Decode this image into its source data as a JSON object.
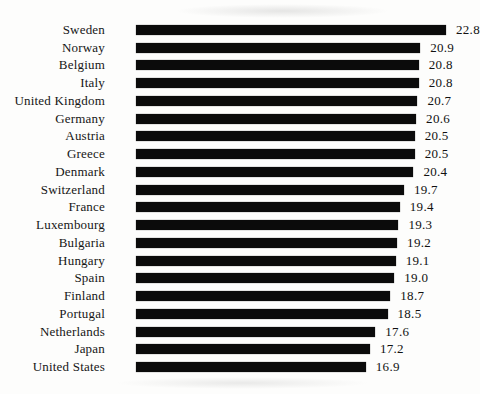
{
  "page": {
    "background_color": "#fdfdfc",
    "bar_color": "#0b0b0b",
    "text_color": "#161616"
  },
  "chart_data": {
    "type": "bar",
    "orientation": "horizontal",
    "title": "",
    "xlabel": "",
    "ylabel": "",
    "grid": false,
    "legend": false,
    "xlim": [
      0,
      22.8
    ],
    "categories": [
      "Sweden",
      "Norway",
      "Belgium",
      "Italy",
      "United Kingdom",
      "Germany",
      "Austria",
      "Greece",
      "Denmark",
      "Switzerland",
      "France",
      "Luxembourg",
      "Bulgaria",
      "Hungary",
      "Spain",
      "Finland",
      "Portugal",
      "Netherlands",
      "Japan",
      "United States"
    ],
    "values": [
      22.8,
      20.9,
      20.8,
      20.8,
      20.7,
      20.6,
      20.5,
      20.5,
      20.4,
      19.7,
      19.4,
      19.3,
      19.2,
      19.1,
      19.0,
      18.7,
      18.5,
      17.6,
      17.2,
      16.9
    ],
    "value_labels": [
      "22.8",
      "20.9",
      "20.8",
      "20.8",
      "20.7",
      "20.6",
      "20.5",
      "20.5",
      "20.4",
      "19.7",
      "19.4",
      "19.3",
      "19.2",
      "19.1",
      "19.0",
      "18.7",
      "18.5",
      "17.6",
      "17.2",
      "16.9"
    ]
  }
}
